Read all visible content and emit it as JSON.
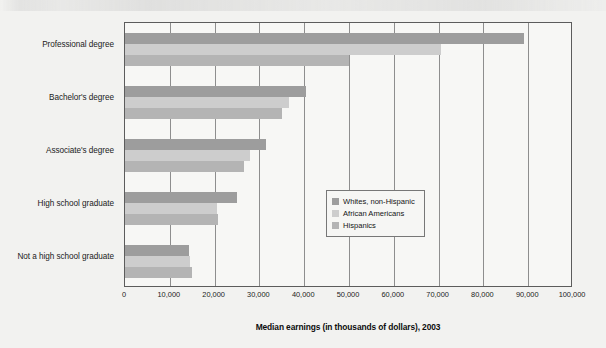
{
  "chart_data": {
    "type": "bar",
    "orientation": "horizontal",
    "title": "",
    "xlabel": "Median earnings (in thousands of dollars), 2003",
    "ylabel": "",
    "xlim": [
      0,
      100000
    ],
    "xticks": [
      "0",
      "10,000",
      "20,000",
      "30,000",
      "40,000",
      "50,000",
      "60,000",
      "70,000",
      "80,000",
      "90,000",
      "100,000"
    ],
    "xtick_values": [
      0,
      10000,
      20000,
      30000,
      40000,
      50000,
      60000,
      70000,
      80000,
      90000,
      100000
    ],
    "grid": true,
    "legend_position": "middle-right-inside",
    "categories": [
      "Professional degree",
      "Bachelor's degree",
      "Associate's degree",
      "High school graduate",
      "Not a high school graduate"
    ],
    "series": [
      {
        "name": "Whites, non-Hispanic",
        "color": "#9d9d9d",
        "values": [
          89000,
          40500,
          31500,
          25000,
          14300
        ]
      },
      {
        "name": "African Americans",
        "color": "#cdcdcd",
        "values": [
          70500,
          36500,
          28000,
          20500,
          14500
        ]
      },
      {
        "name": "Hispanics",
        "color": "#b4b4b4",
        "values": [
          50000,
          35000,
          26500,
          20800,
          15000
        ]
      }
    ]
  },
  "legend": {
    "items": [
      {
        "label": "Whites, non-Hispanic",
        "color": "#9d9d9d"
      },
      {
        "label": "African Americans",
        "color": "#cdcdcd"
      },
      {
        "label": "Hispanics",
        "color": "#b4b4b4"
      }
    ]
  }
}
